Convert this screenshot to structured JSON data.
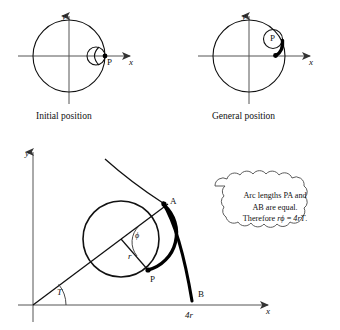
{
  "figure": {
    "panels": [
      {
        "id": "initial",
        "caption": "Initial position",
        "axis_x_label": "x",
        "axis_y_label": "y",
        "point_labels": [
          "P"
        ]
      },
      {
        "id": "general",
        "caption": "General position",
        "axis_x_label": "x",
        "axis_y_label": "y",
        "point_labels": [
          "P"
        ]
      },
      {
        "id": "main",
        "axis_x_label": "x",
        "axis_y_label": "y",
        "point_labels": [
          "A",
          "P",
          "B"
        ],
        "angle_labels": [
          "ϕ",
          "T"
        ],
        "radius_label": "r",
        "x_tick_label": "4r"
      }
    ],
    "callout": {
      "line1": "Arc lengths PA and",
      "line2": "AB are equal.",
      "line3_prefix": "Therefore ",
      "line3_math_a": "rϕ",
      "line3_equals": " = ",
      "line3_math_b": "4rT",
      "line3_suffix": "."
    },
    "colors": {
      "background": "#ffffff",
      "ink": "#111111",
      "axis": "#555555",
      "cloud_stroke": "#4a4a4a"
    }
  }
}
